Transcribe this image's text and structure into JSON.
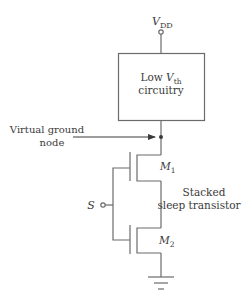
{
  "diagram": {
    "supply": {
      "symbol": "V",
      "subscript": "DD"
    },
    "block": {
      "line1": "Low ",
      "symbol": "V",
      "subscript": "th",
      "line2": "circuitry"
    },
    "virtual_ground": {
      "line1": "Virtual ground",
      "line2": "node"
    },
    "transistors": [
      {
        "symbol": "M",
        "subscript": "1"
      },
      {
        "symbol": "M",
        "subscript": "2"
      }
    ],
    "sleep_input": {
      "label": "S"
    },
    "annotation": {
      "line1": "Stacked",
      "line2": "sleep transistor"
    },
    "colors": {
      "line": "#6b6b6b",
      "text": "#3a3a3a",
      "background": "#ffffff"
    }
  }
}
